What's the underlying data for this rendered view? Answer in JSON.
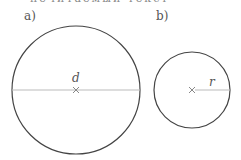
{
  "top_text": "нечитаемый текст",
  "figures": [
    {
      "label": "a)",
      "variable": "d",
      "measure": "diameter"
    },
    {
      "label": "b)",
      "variable": "r",
      "measure": "radius"
    }
  ],
  "colors": {
    "outline": "#444444",
    "line": "#bbbbbb"
  }
}
